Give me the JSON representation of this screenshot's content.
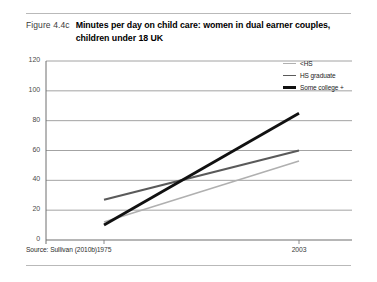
{
  "figure": {
    "number": "Figure 4.4c",
    "title": "Minutes per day on child care: women in dual earner couples, children under 18 UK",
    "source": "Source: Sullivan (2010b)"
  },
  "colors": {
    "less_than_hs": "#b0b0b0",
    "hs_graduate": "#5a5a5a",
    "some_college": "#111111",
    "gridline": "#8c8c8c",
    "axis": "#6e6e6e"
  },
  "chart_data": {
    "type": "line",
    "title": "Minutes per day on child care: women in dual earner couples, children under 18 UK",
    "xlabel": "",
    "ylabel": "",
    "x": [
      1975,
      2003
    ],
    "xtick_labels": [
      "1975",
      "2003"
    ],
    "ylim": [
      0,
      120
    ],
    "ytick_labels": [
      "0",
      "20",
      "40",
      "60",
      "80",
      "100",
      "120"
    ],
    "yticks": [
      0,
      20,
      40,
      60,
      80,
      100,
      120
    ],
    "grid": true,
    "legend_position": "top-right",
    "series": [
      {
        "name": "<HS",
        "values": [
          12,
          53
        ],
        "color": "#b0b0b0",
        "width": 1.6
      },
      {
        "name": "HS graduate",
        "values": [
          27,
          60
        ],
        "color": "#5a5a5a",
        "width": 2.2
      },
      {
        "name": "Some college +",
        "values": [
          10,
          85
        ],
        "color": "#111111",
        "width": 2.8
      }
    ]
  }
}
